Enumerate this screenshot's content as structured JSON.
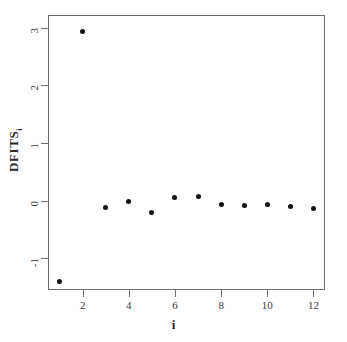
{
  "chart_data": {
    "type": "scatter",
    "title": "",
    "xlabel": "i",
    "ylabel": "DFITS",
    "ylabel_sub": "i",
    "x": [
      1,
      2,
      3,
      4,
      5,
      6,
      7,
      8,
      9,
      10,
      11,
      12
    ],
    "values": [
      -1.4,
      2.93,
      -0.12,
      -0.02,
      -0.21,
      0.05,
      0.07,
      -0.07,
      -0.08,
      -0.07,
      -0.1,
      -0.14
    ],
    "xticks": [
      2,
      4,
      6,
      8,
      10,
      12
    ],
    "xticklabels": [
      "2",
      "4",
      "6",
      "8",
      "10",
      "12"
    ],
    "yticks": [
      3,
      2,
      1,
      0,
      -1
    ],
    "yticklabels": [
      "3",
      "2",
      "1",
      "0",
      "-1"
    ],
    "xlim": [
      0.5,
      12.5
    ],
    "ylim": [
      -1.55,
      3.22
    ],
    "grid": false,
    "legend": false,
    "marker": "filled-circle",
    "marker_color": "#111111",
    "frame_color": "#6e6e6e",
    "background": "#ffffff"
  }
}
